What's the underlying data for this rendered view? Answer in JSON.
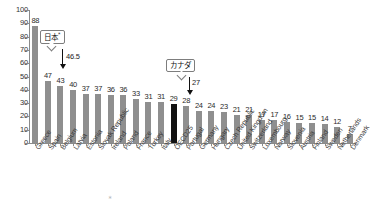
{
  "chart_data": {
    "type": "bar",
    "title": "",
    "xlabel": "",
    "ylabel": "",
    "ylim": [
      0,
      100
    ],
    "yticks": [
      0,
      10,
      20,
      30,
      40,
      50,
      60,
      70,
      80,
      90,
      100
    ],
    "grid": false,
    "legend": "none",
    "categories": [
      "Greece",
      "Spain",
      "Belgium",
      "Latvia",
      "Estonia",
      "Slovak Republic",
      "Ireland",
      "Poland",
      "France",
      "Turkey",
      "Italy",
      "OECD25",
      "Portugal",
      "Germany",
      "Hungary",
      "Czech Republic",
      "United Kingdom",
      "Switzerland",
      "Luxembourg",
      "Norway",
      "Slovenia",
      "Austria",
      "Finland",
      "Sweden",
      "Netherlands",
      "Denmark"
    ],
    "values": [
      88,
      47,
      43,
      40,
      37,
      37,
      36,
      36,
      33,
      31,
      31,
      29,
      28,
      24,
      24,
      23,
      21,
      21,
      17,
      17,
      16,
      15,
      15,
      14,
      12,
      7
    ],
    "value_labels": [
      "88",
      "47",
      "43",
      "40",
      "37",
      "37",
      "36",
      "36",
      "33",
      "31",
      "31",
      "29",
      "28",
      "24",
      "24",
      "23",
      "21",
      "21",
      "17",
      "17",
      "16",
      "15",
      "15",
      "14",
      "12",
      "7"
    ],
    "highlight_index": 11,
    "highlight_category": "OECD25",
    "bar_color": "#8f8f8f",
    "highlight_color": "#111111",
    "annotations": [
      {
        "label": "日本",
        "label_superscript": "*",
        "value": "46.5",
        "points_to": "between Spain and Belgium",
        "arrow": "down"
      },
      {
        "label": "カナダ",
        "label_superscript": "",
        "value": "27",
        "points_to": "between Portugal and Germany",
        "arrow": "down"
      }
    ]
  },
  "axis": {
    "y_tick_labels": [
      "100",
      "90",
      "80",
      "70",
      "60",
      "50",
      "40",
      "30",
      "20",
      "10",
      "0"
    ]
  },
  "footer": {
    "note": ""
  }
}
